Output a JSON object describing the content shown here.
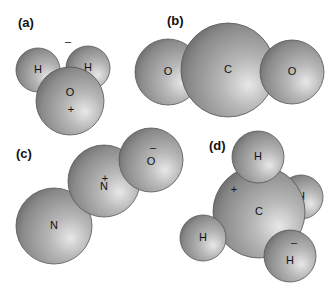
{
  "figure": {
    "panels": [
      {
        "label": "(a)",
        "molecule": "H2O",
        "atoms": [
          {
            "symbol": "H",
            "cx": 38,
            "cy": 70,
            "r": 22
          },
          {
            "symbol": "H",
            "cx": 88,
            "cy": 68,
            "r": 22
          },
          {
            "symbol": "O",
            "cx": 70,
            "cy": 101,
            "r": 34
          }
        ],
        "charges": [
          {
            "sign": "–",
            "x": 68,
            "y": 42
          },
          {
            "sign": "+",
            "x": 71,
            "y": 110
          }
        ]
      },
      {
        "label": "(b)",
        "molecule": "CO2",
        "atoms": [
          {
            "symbol": "O",
            "cx": 168,
            "cy": 72,
            "r": 33
          },
          {
            "symbol": "C",
            "cx": 228,
            "cy": 70,
            "r": 47
          },
          {
            "symbol": "O",
            "cx": 292,
            "cy": 72,
            "r": 32
          }
        ],
        "charges": []
      },
      {
        "label": "(c)",
        "molecule": "N2O",
        "atoms": [
          {
            "symbol": "N",
            "cx": 54,
            "cy": 226,
            "r": 38
          },
          {
            "symbol": "N",
            "cx": 104,
            "cy": 181,
            "r": 36
          },
          {
            "symbol": "O",
            "cx": 151,
            "cy": 160,
            "r": 32
          }
        ],
        "charges": [
          {
            "sign": "+",
            "x": 105,
            "y": 179
          },
          {
            "sign": "–",
            "x": 153,
            "y": 148
          }
        ]
      },
      {
        "label": "(d)",
        "molecule": "CH4",
        "atoms": [
          {
            "symbol": "H",
            "cx": 301,
            "cy": 197,
            "r": 22
          },
          {
            "symbol": "C",
            "cx": 259,
            "cy": 212,
            "r": 46
          },
          {
            "symbol": "H",
            "cx": 258,
            "cy": 157,
            "r": 26
          },
          {
            "symbol": "H",
            "cx": 203,
            "cy": 238,
            "r": 23
          },
          {
            "symbol": "H",
            "cx": 290,
            "cy": 256,
            "r": 26
          }
        ],
        "charges": [
          {
            "sign": "+",
            "x": 234,
            "y": 190
          },
          {
            "sign": "–",
            "x": 294,
            "y": 243
          }
        ]
      }
    ],
    "label_positions": [
      {
        "x": 18,
        "y": 27
      },
      {
        "x": 167,
        "y": 25
      },
      {
        "x": 16,
        "y": 158
      },
      {
        "x": 209,
        "y": 150
      }
    ]
  }
}
